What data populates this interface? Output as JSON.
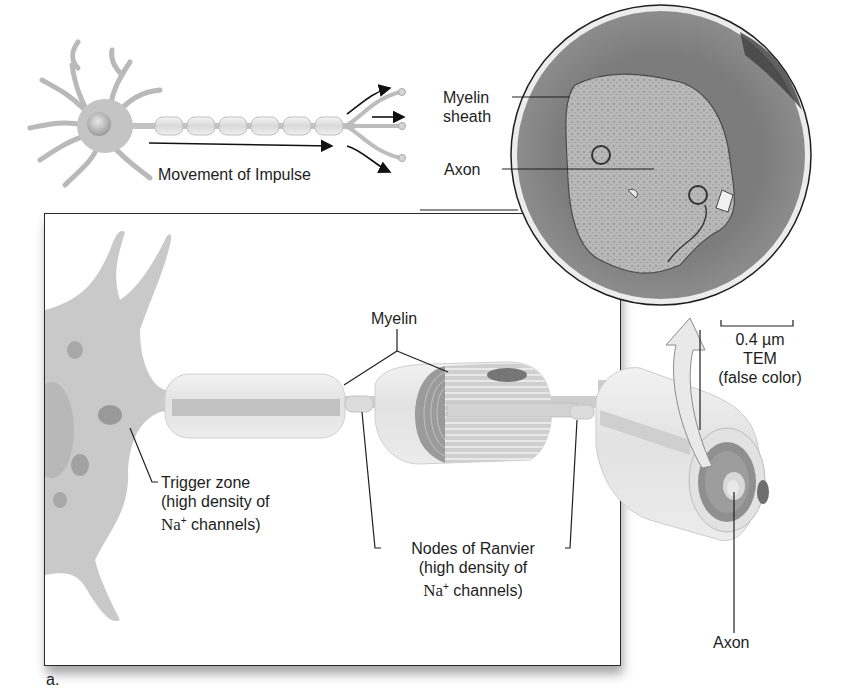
{
  "figure": {
    "panel_label": "a.",
    "overview": {
      "caption": "Movement of Impulse"
    },
    "micrograph": {
      "labels": {
        "myelin_sheath": "Myelin\nsheath",
        "myelin_line1": "Myelin",
        "myelin_line2": "sheath",
        "axon": "Axon"
      },
      "scale_bar": "0.4 µm",
      "method": "TEM",
      "note": "(false color)"
    },
    "detail": {
      "myelin": "Myelin",
      "trigger_zone": {
        "line1": "Trigger zone",
        "line2": "(high density of",
        "line3_ion": "Na",
        "line3_charge": "+",
        "line3_rest": " channels)"
      },
      "nodes_of_ranvier": {
        "line1": "Nodes of Ranvier",
        "line2": "(high density of",
        "line3_ion": "Na",
        "line3_charge": "+",
        "line3_rest": " channels)"
      },
      "axon": "Axon"
    }
  },
  "colors": {
    "neuron_fill": "#c8c8c8",
    "myelin_fill": "#e6e6e6",
    "myelin_band": "#bdbdbd",
    "tem_outer": "#7d7d7d",
    "tem_inner": "#b4b4b4",
    "line": "#1f1f1f"
  }
}
